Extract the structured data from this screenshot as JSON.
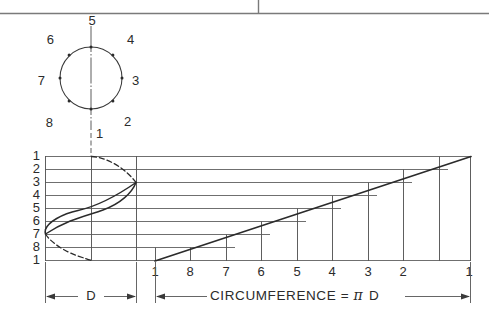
{
  "figure": {
    "title_border": {
      "present": true
    },
    "circle_view": {
      "name": "end-view-circle",
      "center": {
        "x": 91,
        "y": 78
      },
      "radius": 31,
      "point_labels": [
        "1",
        "2",
        "3",
        "4",
        "5",
        "6",
        "7",
        "8"
      ],
      "points": [
        {
          "label": "1",
          "angle_deg": 270,
          "text_x": 96,
          "text_y": 135
        },
        {
          "label": "2",
          "angle_deg": 315,
          "text_x": 124,
          "text_y": 123
        },
        {
          "label": "3",
          "angle_deg": 0,
          "text_x": 132,
          "text_y": 82
        },
        {
          "label": "4",
          "angle_deg": 45,
          "text_x": 127,
          "text_y": 41
        },
        {
          "label": "5",
          "angle_deg": 90,
          "text_x": 92,
          "text_y": 22
        },
        {
          "label": "6",
          "angle_deg": 135,
          "text_x": 54,
          "text_y": 41
        },
        {
          "label": "7",
          "angle_deg": 180,
          "text_x": 45,
          "text_y": 82
        },
        {
          "label": "8",
          "angle_deg": 225,
          "text_x": 53,
          "text_y": 124
        }
      ]
    },
    "development_view": {
      "name": "helix-development",
      "left_row_labels": [
        "1",
        "2",
        "3",
        "4",
        "5",
        "6",
        "7",
        "8",
        "1"
      ],
      "bottom_station_labels": [
        "1",
        "8",
        "7",
        "6",
        "5",
        "4",
        "3",
        "2",
        "1"
      ],
      "diameter_label": "D",
      "circumference_label": "CIRCUMFERENCE =",
      "pi_symbol": "π",
      "diameter_symbol": "D",
      "curve_style_note": "sine-curve-front-view",
      "ramp_note": "helix-developed-as-straight-line"
    },
    "colors": {
      "line": "#3a3a3a",
      "grid": "#555555",
      "text": "#2b2b2b",
      "background": "#ffffff"
    }
  }
}
